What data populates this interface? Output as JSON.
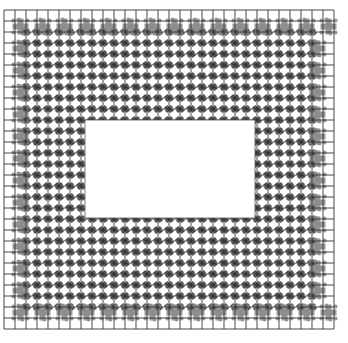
{
  "diagram": {
    "type": "package-pinout-grid",
    "grid": {
      "origin_x": 4,
      "origin_y": 10,
      "cell_size": 11,
      "columns": 30,
      "rows": 29,
      "line_color": "#333333"
    },
    "outer_ring": {
      "depth_cells": 2,
      "pad_color": "#8c8c8c",
      "pattern": "cross-clusters"
    },
    "inner_field": {
      "pad_color": "#3a3a3a",
      "pattern": "pinwheel-at-intersections"
    },
    "cutout": {
      "x": 85,
      "y": 120,
      "width": 170,
      "height": 98,
      "fill": "#ffffff"
    }
  }
}
